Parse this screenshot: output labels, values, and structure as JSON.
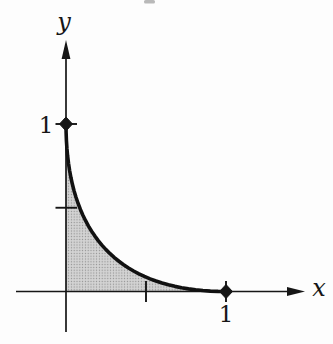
{
  "figure": {
    "labels": {
      "x_axis": "x",
      "y_axis": "y",
      "x_unit": "1",
      "y_unit": "1"
    },
    "colors": {
      "ink": "#161616",
      "curve": "#111111",
      "shade_base": "#d3d3d3",
      "shade_dot": "#8e8e8e",
      "background": "#fdfdfd"
    }
  },
  "chart_data": {
    "type": "area",
    "xlabel": "x",
    "ylabel": "y",
    "xlim": [
      0,
      1
    ],
    "ylim": [
      0,
      1
    ],
    "grid": false,
    "x": [
      0,
      0.0006,
      0.0025,
      0.0056,
      0.01,
      0.0156,
      0.0225,
      0.0306,
      0.04,
      0.0506,
      0.0625,
      0.0756,
      0.09,
      0.1056,
      0.1225,
      0.1406,
      0.16,
      0.1806,
      0.2025,
      0.2256,
      0.25,
      0.2756,
      0.3025,
      0.3306,
      0.36,
      0.3906,
      0.4225,
      0.4556,
      0.49,
      0.5256,
      0.5625,
      0.6006,
      0.64,
      0.6806,
      0.7225,
      0.7656,
      0.81,
      0.8556,
      0.9025,
      0.9506,
      1
    ],
    "y": [
      1,
      0.9506,
      0.9025,
      0.8556,
      0.81,
      0.7656,
      0.7225,
      0.6806,
      0.64,
      0.6006,
      0.5625,
      0.5256,
      0.49,
      0.4556,
      0.4225,
      0.3906,
      0.36,
      0.3306,
      0.3025,
      0.2756,
      0.25,
      0.2256,
      0.2025,
      0.1806,
      0.16,
      0.1406,
      0.1225,
      0.1056,
      0.09,
      0.0756,
      0.0625,
      0.0506,
      0.04,
      0.0306,
      0.0225,
      0.0156,
      0.01,
      0.0056,
      0.0025,
      0.0006,
      0
    ],
    "x_ticks": [
      0.5,
      1
    ],
    "y_ticks": [
      0.5,
      1
    ],
    "x_tick_labels": [
      {
        "value": 1,
        "label": "1"
      }
    ],
    "y_tick_labels": [
      {
        "value": 1,
        "label": "1"
      }
    ],
    "marked_points": [
      {
        "x": 0,
        "y": 1
      },
      {
        "x": 1,
        "y": 0
      }
    ],
    "shaded_region": "area enclosed between the curve and the coordinate axes"
  }
}
